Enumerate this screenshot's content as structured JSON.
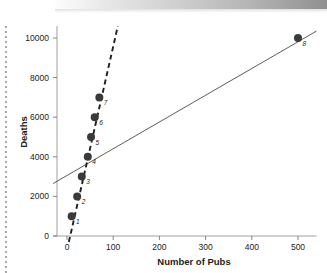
{
  "figure": {
    "background_color": "#ffffff",
    "artifacts": {
      "top_gradient_bar": "gray-gradient-scan-bar",
      "left_dotted_rule": "dotted-scan-edge"
    }
  },
  "chart_data": {
    "type": "scatter",
    "title": "",
    "subtitle": "",
    "xlabel": "Number of Pubs",
    "ylabel": "Deaths",
    "xlim": [
      -30,
      540
    ],
    "ylim": [
      -400,
      10600
    ],
    "xticks": [
      0,
      100,
      200,
      300,
      400,
      500
    ],
    "xticklabels": [
      "0",
      "100",
      "200",
      "300",
      "400",
      "500"
    ],
    "yticks": [
      0,
      2000,
      4000,
      6000,
      8000,
      10000
    ],
    "yticklabels": [
      "0",
      "2000",
      "4000",
      "6000",
      "8000",
      "10000"
    ],
    "grid": false,
    "legend": null,
    "marker_color": "#3a3a3a",
    "line_color": "#4a4a4a",
    "points": [
      {
        "label": "1",
        "x": 10,
        "y": 1000
      },
      {
        "label": "2",
        "x": 22,
        "y": 2000
      },
      {
        "label": "3",
        "x": 32,
        "y": 3000
      },
      {
        "label": "4",
        "x": 45,
        "y": 4000
      },
      {
        "label": "5",
        "x": 52,
        "y": 5000
      },
      {
        "label": "6",
        "x": 60,
        "y": 6000
      },
      {
        "label": "7",
        "x": 70,
        "y": 7000
      },
      {
        "label": "8",
        "x": 500,
        "y": 10000
      }
    ],
    "series": [
      {
        "name": "regression-all-points",
        "type": "line",
        "style": "solid",
        "x": [
          -30,
          540
        ],
        "y": [
          2650,
          10350
        ]
      },
      {
        "name": "regression-excluding-outlier",
        "type": "line",
        "style": "dashed",
        "x": [
          4,
          110
        ],
        "y": [
          -300,
          10600
        ]
      }
    ]
  }
}
